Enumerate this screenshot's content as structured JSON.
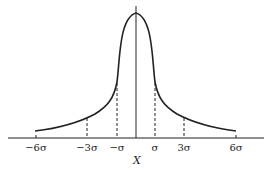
{
  "diagram": {
    "title": "",
    "type": "distribution-curve",
    "x_axis_label": "X",
    "tick_labels": [
      "−6σ",
      "−3σ",
      "−σ",
      "σ",
      "3σ",
      "6σ"
    ],
    "markers": [
      {
        "label": "−3σ",
        "style": "dashed"
      },
      {
        "label": "−σ",
        "style": "dashed"
      },
      {
        "label": "center",
        "style": "solid"
      },
      {
        "label": "σ",
        "style": "dashed"
      },
      {
        "label": "3σ",
        "style": "dashed"
      }
    ],
    "colors": {
      "line": "#222222",
      "background": "#ffffff"
    }
  }
}
